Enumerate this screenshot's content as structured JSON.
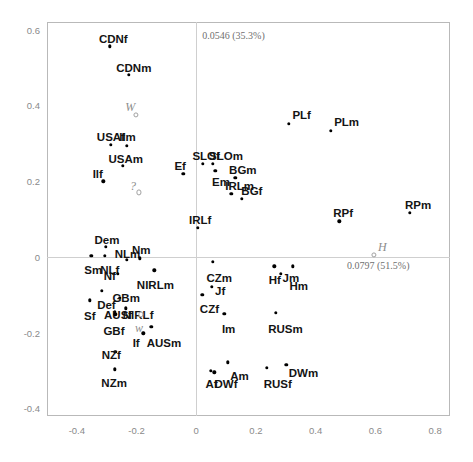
{
  "chart_data": {
    "type": "scatter",
    "title": "",
    "xlabel": "",
    "ylabel": "",
    "xlim": [
      -0.5,
      0.85
    ],
    "ylim": [
      -0.42,
      0.62
    ],
    "grid": false,
    "legend": null,
    "axis_annotations": {
      "vertical_axis_label": "0.0546 (35.3%)",
      "horizontal_axis_label": "0.0797 (51.5%)"
    },
    "xticks": [
      "-0.4",
      "-0.2",
      "0",
      "0.2",
      "0.4",
      "0.6",
      "0.8"
    ],
    "xtick_values": [
      -0.4,
      -0.2,
      0,
      0.2,
      0.4,
      0.6,
      0.8
    ],
    "yticks": [
      "0.6",
      "0.4",
      "0.2",
      "0",
      "-0.2",
      "-0.4"
    ],
    "ytick_values": [
      0.6,
      0.4,
      0.2,
      0,
      -0.2,
      -0.4
    ],
    "points": [
      {
        "label": "CDNf",
        "x": -0.289,
        "y": 0.556,
        "kind": "active",
        "lx": -0.326,
        "ly": 0.588
      },
      {
        "label": "CDNm",
        "x": -0.225,
        "y": 0.48,
        "kind": "active",
        "lx": -0.268,
        "ly": 0.513
      },
      {
        "label": "W",
        "x": -0.202,
        "y": 0.374,
        "kind": "supplementary",
        "lx": -0.238,
        "ly": 0.412
      },
      {
        "label": "USAf",
        "x": -0.287,
        "y": 0.296,
        "kind": "active",
        "lx": -0.333,
        "ly": 0.33
      },
      {
        "label": "Ilm",
        "x": -0.233,
        "y": 0.294,
        "kind": "active",
        "lx": -0.258,
        "ly": 0.33
      },
      {
        "label": "USAm",
        "x": -0.246,
        "y": 0.24,
        "kind": "active",
        "lx": -0.294,
        "ly": 0.272
      },
      {
        "label": "Ilf",
        "x": -0.311,
        "y": 0.2,
        "kind": "active",
        "lx": -0.347,
        "ly": 0.232
      },
      {
        "label": "?",
        "x": -0.192,
        "y": 0.17,
        "kind": "supplementary",
        "lx": -0.222,
        "ly": 0.203
      },
      {
        "label": "Ef",
        "x": -0.044,
        "y": 0.219,
        "kind": "active",
        "lx": -0.073,
        "ly": 0.252
      },
      {
        "label": "SLOf",
        "x": 0.021,
        "y": 0.245,
        "kind": "active",
        "lx": -0.013,
        "ly": 0.279
      },
      {
        "label": "SLOm",
        "x": 0.056,
        "y": 0.246,
        "kind": "active",
        "lx": 0.043,
        "ly": 0.279
      },
      {
        "label": "Em",
        "x": 0.064,
        "y": 0.228,
        "kind": "active",
        "lx": 0.053,
        "ly": 0.212
      },
      {
        "label": "BGm",
        "x": 0.131,
        "y": 0.209,
        "kind": "active",
        "lx": 0.11,
        "ly": 0.243
      },
      {
        "label": "IRLm",
        "x": 0.118,
        "y": 0.166,
        "kind": "active",
        "lx": 0.097,
        "ly": 0.2
      },
      {
        "label": "BGf",
        "x": 0.153,
        "y": 0.153,
        "kind": "active",
        "lx": 0.151,
        "ly": 0.186
      },
      {
        "label": "PLf",
        "x": 0.31,
        "y": 0.352,
        "kind": "active",
        "lx": 0.322,
        "ly": 0.388
      },
      {
        "label": "PLm",
        "x": 0.45,
        "y": 0.332,
        "kind": "active",
        "lx": 0.462,
        "ly": 0.368
      },
      {
        "label": "RPf",
        "x": 0.479,
        "y": 0.094,
        "kind": "active",
        "lx": 0.459,
        "ly": 0.128
      },
      {
        "label": "RPm",
        "x": 0.715,
        "y": 0.117,
        "kind": "active",
        "lx": 0.699,
        "ly": 0.15
      },
      {
        "label": "H",
        "x": 0.596,
        "y": 0.006,
        "kind": "supplementary",
        "lx": 0.609,
        "ly": 0.041
      },
      {
        "label": "IRLf",
        "x": 0.006,
        "y": 0.077,
        "kind": "active",
        "lx": -0.024,
        "ly": 0.111
      },
      {
        "label": "Dem",
        "x": -0.303,
        "y": 0.026,
        "kind": "active",
        "lx": -0.341,
        "ly": 0.059
      },
      {
        "label": "Sm",
        "x": -0.352,
        "y": 0.003,
        "kind": "active",
        "lx": -0.375,
        "ly": -0.022
      },
      {
        "label": "NLf",
        "x": -0.307,
        "y": 0.003,
        "kind": "active",
        "lx": -0.322,
        "ly": -0.021
      },
      {
        "label": "NLm",
        "x": -0.233,
        "y": -0.007,
        "kind": "active",
        "lx": -0.273,
        "ly": 0.022
      },
      {
        "label": "Nm",
        "x": -0.19,
        "y": -0.004,
        "kind": "active",
        "lx": -0.215,
        "ly": 0.031
      },
      {
        "label": "Nf",
        "x": -0.262,
        "y": -0.045,
        "kind": "active",
        "lx": -0.31,
        "ly": -0.036
      },
      {
        "label": "NIRLm",
        "x": -0.141,
        "y": -0.035,
        "kind": "active",
        "lx": -0.199,
        "ly": -0.062
      },
      {
        "label": "Def",
        "x": -0.317,
        "y": -0.09,
        "kind": "active",
        "lx": -0.332,
        "ly": -0.115
      },
      {
        "label": "GBm",
        "x": -0.256,
        "y": -0.108,
        "kind": "active",
        "lx": -0.281,
        "ly": -0.095
      },
      {
        "label": "Sf",
        "x": -0.357,
        "y": -0.115,
        "kind": "active",
        "lx": -0.376,
        "ly": -0.143
      },
      {
        "label": "AUSf",
        "x": -0.273,
        "y": -0.145,
        "kind": "active",
        "lx": -0.309,
        "ly": -0.14
      },
      {
        "label": "NIRLf",
        "x": -0.235,
        "y": -0.136,
        "kind": "active",
        "lx": -0.246,
        "ly": -0.139
      },
      {
        "label": "GBf",
        "x": -0.271,
        "y": -0.152,
        "kind": "active",
        "lx": -0.311,
        "ly": -0.182
      },
      {
        "label": "w",
        "x": -0.186,
        "y": -0.152,
        "kind": "supplementary",
        "lx": -0.205,
        "ly": -0.172
      },
      {
        "label": "AUSm",
        "x": -0.151,
        "y": -0.185,
        "kind": "active",
        "lx": -0.166,
        "ly": -0.214
      },
      {
        "label": "If",
        "x": -0.177,
        "y": -0.202,
        "kind": "active",
        "lx": -0.213,
        "ly": -0.213
      },
      {
        "label": "NZf",
        "x": -0.271,
        "y": -0.251,
        "kind": "active",
        "lx": -0.317,
        "ly": -0.246
      },
      {
        "label": "NZm",
        "x": -0.273,
        "y": -0.297,
        "kind": "active",
        "lx": -0.318,
        "ly": -0.32
      },
      {
        "label": "CZm",
        "x": 0.056,
        "y": -0.013,
        "kind": "active",
        "lx": 0.034,
        "ly": -0.042
      },
      {
        "label": "Jf",
        "x": 0.053,
        "y": -0.079,
        "kind": "active",
        "lx": 0.063,
        "ly": -0.078
      },
      {
        "label": "CZf",
        "x": 0.02,
        "y": -0.1,
        "kind": "active",
        "lx": 0.012,
        "ly": -0.125
      },
      {
        "label": "Hf",
        "x": 0.262,
        "y": -0.025,
        "kind": "active",
        "lx": 0.243,
        "ly": -0.047
      },
      {
        "label": "Jm",
        "x": 0.283,
        "y": -0.044,
        "kind": "active",
        "lx": 0.289,
        "ly": -0.042
      },
      {
        "label": "Hm",
        "x": 0.323,
        "y": -0.025,
        "kind": "active",
        "lx": 0.312,
        "ly": -0.063
      },
      {
        "label": "Im",
        "x": 0.094,
        "y": -0.151,
        "kind": "active",
        "lx": 0.086,
        "ly": -0.178
      },
      {
        "label": "RUSm",
        "x": 0.266,
        "y": -0.148,
        "kind": "active",
        "lx": 0.241,
        "ly": -0.177
      },
      {
        "label": "Am",
        "x": 0.105,
        "y": -0.278,
        "kind": "active",
        "lx": 0.114,
        "ly": -0.302
      },
      {
        "label": "Af",
        "x": 0.049,
        "y": -0.3,
        "kind": "active",
        "lx": 0.031,
        "ly": -0.322
      },
      {
        "label": "DWf",
        "x": 0.06,
        "y": -0.305,
        "kind": "active",
        "lx": 0.061,
        "ly": -0.323
      },
      {
        "label": "RUSf",
        "x": 0.237,
        "y": -0.292,
        "kind": "active",
        "lx": 0.226,
        "ly": -0.323
      },
      {
        "label": "DWm",
        "x": 0.301,
        "y": -0.285,
        "kind": "active",
        "lx": 0.31,
        "ly": -0.294
      }
    ]
  }
}
